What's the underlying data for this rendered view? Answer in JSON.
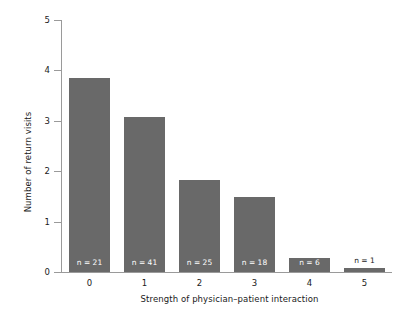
{
  "chart_data": {
    "type": "bar",
    "title": "",
    "xlabel": "Strength of physician–patient interaction",
    "ylabel": "Number of return visits",
    "categories": [
      "0",
      "1",
      "2",
      "3",
      "4",
      "5"
    ],
    "values": [
      3.84,
      3.07,
      1.82,
      1.49,
      0.28,
      0.08
    ],
    "annotations": [
      "n = 21",
      "n = 41",
      "n = 25",
      "n = 18",
      "n = 6",
      "n = 1"
    ],
    "counts": [
      21,
      41,
      25,
      18,
      6,
      1
    ],
    "ylim": [
      0,
      5
    ],
    "yticks": [
      "0",
      "1",
      "2",
      "3",
      "4",
      "5"
    ],
    "ytick_values": [
      0,
      1,
      2,
      3,
      4,
      5
    ],
    "xticks": [
      "0",
      "1",
      "2",
      "3",
      "4",
      "5"
    ],
    "grid": false,
    "legend": false,
    "bar_color": "#696969",
    "background_color": "#ffffff",
    "axis_color": "#9a9a9a",
    "text_color": "#1a1a1a"
  }
}
